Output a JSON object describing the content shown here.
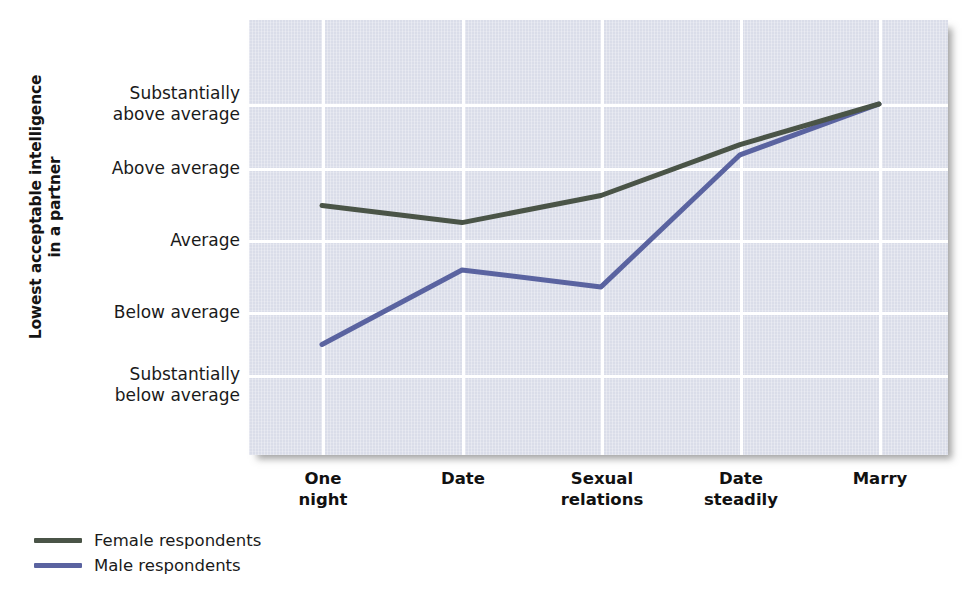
{
  "chart_data": {
    "type": "line",
    "title": "",
    "xlabel": "",
    "ylabel": "Lowest acceptable intelligence\nin a partner",
    "categories": [
      "One\nnight",
      "Date",
      "Sexual\nrelations",
      "Date\nsteadily",
      "Marry"
    ],
    "category_names": [
      "One night",
      "Date",
      "Sexual relations",
      "Date steadily",
      "Marry"
    ],
    "ytick_labels": [
      "Substantially\nabove average",
      "Above average",
      "Average",
      "Below average",
      "Substantially\nbelow average"
    ],
    "ytick_values": [
      5,
      4,
      3,
      2,
      1
    ],
    "ylim": [
      0.5,
      5.6
    ],
    "grid": true,
    "legend_position": "below-left",
    "series": [
      {
        "name": "Female respondents",
        "color": "#4a5447",
        "values": [
          3.5,
          3.25,
          3.65,
          4.4,
          5.0
        ]
      },
      {
        "name": "Male respondents",
        "color": "#5a63a0",
        "values": [
          1.45,
          2.55,
          2.3,
          4.25,
          5.0
        ]
      }
    ]
  },
  "legend": {
    "items": [
      {
        "label": "Female respondents",
        "color": "#4a5447"
      },
      {
        "label": "Male respondents",
        "color": "#5a63a0"
      }
    ]
  }
}
